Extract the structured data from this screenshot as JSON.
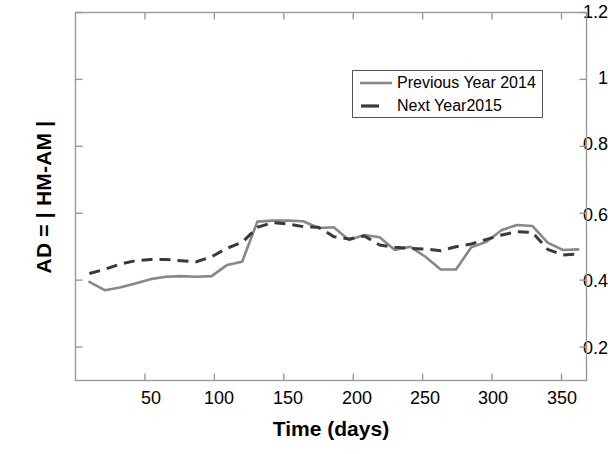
{
  "chart_data": {
    "type": "line",
    "title": "",
    "xlabel": "Time (days)",
    "ylabel": "AD = | HM-AM |",
    "xlim": [
      0,
      368
    ],
    "ylim": [
      0.1,
      1.2
    ],
    "xticks": [
      50,
      100,
      150,
      200,
      250,
      300,
      350
    ],
    "yticks": [
      "0.2",
      "0.4",
      "0.6",
      "0.8",
      "1",
      "1.2"
    ],
    "ytick_values": [
      0.2,
      0.4,
      0.6,
      0.8,
      1.0,
      1.2
    ],
    "grid": false,
    "legend_position": "upper right",
    "series": [
      {
        "name": "Previous Year 2014",
        "style": "solid",
        "color": "#888888",
        "x": [
          10,
          21,
          32,
          43,
          54,
          65,
          76,
          87,
          98,
          109,
          120,
          131,
          142,
          153,
          164,
          175,
          186,
          197,
          208,
          219,
          230,
          241,
          252,
          263,
          274,
          285,
          296,
          307,
          318,
          329,
          340,
          351,
          362
        ],
        "y": [
          0.395,
          0.37,
          0.378,
          0.39,
          0.403,
          0.41,
          0.412,
          0.41,
          0.412,
          0.445,
          0.455,
          0.575,
          0.578,
          0.578,
          0.576,
          0.556,
          0.558,
          0.52,
          0.535,
          0.528,
          0.49,
          0.5,
          0.47,
          0.432,
          0.432,
          0.498,
          0.515,
          0.55,
          0.565,
          0.562,
          0.512,
          0.49,
          0.492
        ]
      },
      {
        "name": "Next Year2015",
        "style": "dashed",
        "color": "#3a3a3a",
        "x": [
          10,
          21,
          32,
          43,
          54,
          65,
          76,
          87,
          98,
          109,
          120,
          131,
          142,
          153,
          164,
          175,
          186,
          197,
          208,
          219,
          230,
          241,
          252,
          263,
          274,
          285,
          296,
          307,
          318,
          329,
          340,
          351,
          362
        ],
        "y": [
          0.42,
          0.432,
          0.448,
          0.458,
          0.462,
          0.462,
          0.458,
          0.455,
          0.47,
          0.495,
          0.513,
          0.558,
          0.572,
          0.568,
          0.56,
          0.558,
          0.53,
          0.523,
          0.532,
          0.505,
          0.498,
          0.495,
          0.493,
          0.488,
          0.5,
          0.508,
          0.522,
          0.535,
          0.545,
          0.543,
          0.492,
          0.475,
          0.478
        ]
      }
    ]
  },
  "legend": {
    "entries": [
      {
        "label": "Previous Year 2014"
      },
      {
        "label": "Next Year2015"
      }
    ]
  },
  "axes": {
    "y_tick_labels": [
      "1.2",
      "1",
      "0.8",
      "0.6",
      "0.4",
      "0.2"
    ],
    "x_tick_labels": [
      "50",
      "100",
      "150",
      "200",
      "250",
      "300",
      "350"
    ]
  },
  "colors": {
    "series_previous": "#888888",
    "series_next": "#3a3a3a",
    "axis": "#808080",
    "text": "#000000"
  }
}
